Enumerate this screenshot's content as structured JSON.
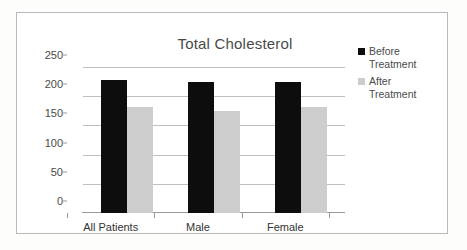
{
  "chart_data": {
    "type": "bar",
    "title": "Total Cholesterol",
    "xlabel": "",
    "ylabel": "",
    "ylim": [
      0,
      250
    ],
    "yticks": [
      0,
      50,
      100,
      150,
      200,
      250
    ],
    "grid": true,
    "legend_position": "right",
    "categories": [
      "All Patients",
      "Male",
      "Female"
    ],
    "series": [
      {
        "name": "Before Treatment",
        "color": "#0d0d0d",
        "values": [
          228,
          225,
          225
        ]
      },
      {
        "name": "After Treatment",
        "color": "#cdcdcd",
        "values": [
          182,
          174,
          181
        ]
      }
    ]
  },
  "axis": {
    "y_tick_labels": [
      "250",
      "200",
      "150",
      "100",
      "50",
      "0"
    ]
  },
  "legend": {
    "items": [
      {
        "label_line1": "Before",
        "label_line2": "Treatment",
        "swatch": "black-square-swatch"
      },
      {
        "label_line1": "After",
        "label_line2": "Treatment",
        "swatch": "gray-square-swatch"
      }
    ]
  },
  "categories": {
    "c0": "All Patients",
    "c1": "Male",
    "c2": "Female"
  }
}
